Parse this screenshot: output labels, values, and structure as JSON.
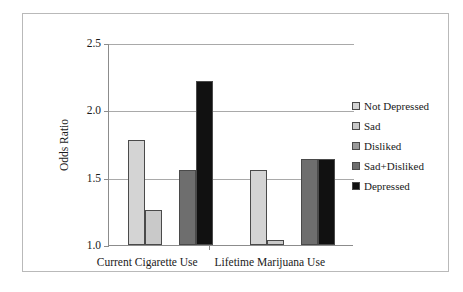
{
  "chart_data": {
    "type": "bar",
    "title": "",
    "xlabel": "",
    "ylabel": "Odds Ratio",
    "ylim": [
      1.0,
      2.5
    ],
    "yticks": [
      "1.0",
      "1.5",
      "2.0",
      "2.5"
    ],
    "ytick_values": [
      1.0,
      1.5,
      2.0,
      2.5
    ],
    "grid": true,
    "legend_position": "right",
    "categories": [
      "Current Cigarette Use",
      "Lifetime Marijuana Use"
    ],
    "series": [
      {
        "name": "Not Depressed",
        "color": "#d4d4d4",
        "values": [
          1.78,
          1.56
        ]
      },
      {
        "name": "Sad",
        "color": "#c9c9c9",
        "values": [
          1.26,
          1.04
        ]
      },
      {
        "name": "Disliked",
        "color": "#9a9a9a",
        "values": [
          1.0,
          1.0
        ]
      },
      {
        "name": "Sad+Disliked",
        "color": "#6e6e6e",
        "values": [
          1.56,
          1.64
        ]
      },
      {
        "name": "Depressed",
        "color": "#111111",
        "values": [
          2.22,
          1.64
        ]
      }
    ]
  },
  "axis": {
    "y_label": "Odds Ratio",
    "y_tick_0": "1.0",
    "y_tick_1": "1.5",
    "y_tick_2": "2.0",
    "y_tick_3": "2.5",
    "x_group_0": "Current Cigarette Use",
    "x_group_1": "Lifetime Marijuana Use"
  },
  "legend": {
    "items": [
      {
        "label": "Not Depressed",
        "swatch": "#d4d4d4"
      },
      {
        "label": "Sad",
        "swatch": "#c9c9c9"
      },
      {
        "label": "Disliked",
        "swatch": "#9a9a9a"
      },
      {
        "label": "Sad+Disliked",
        "swatch": "#6e6e6e"
      },
      {
        "label": "Depressed",
        "swatch": "#111111"
      }
    ]
  }
}
